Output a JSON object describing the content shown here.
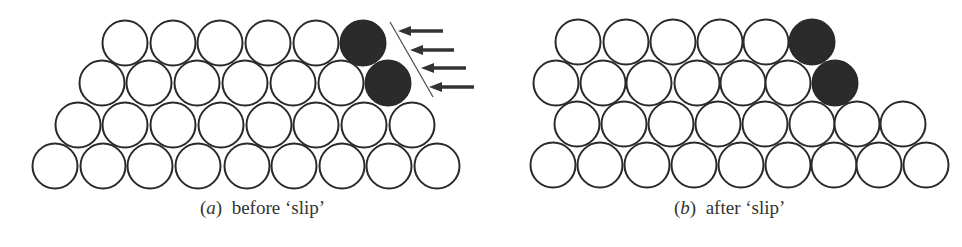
{
  "panels": [
    {
      "id": "a",
      "caption_letter": "a",
      "caption_text": "before ‘slip’",
      "caption_x": 200,
      "rows": [
        {
          "y": 43,
          "x": [
            125,
            173,
            220,
            268,
            316
          ],
          "dark": [
            363
          ]
        },
        {
          "y": 83,
          "x": [
            102,
            149,
            197,
            245,
            293,
            341
          ],
          "dark": [
            388
          ]
        },
        {
          "y": 125,
          "x": [
            78,
            125,
            173,
            221,
            269,
            316,
            364,
            412
          ],
          "dark": []
        },
        {
          "y": 166,
          "x": [
            55,
            103,
            150,
            198,
            247,
            294,
            342,
            389,
            437
          ],
          "dark": []
        }
      ],
      "slip_line": {
        "x1": 390,
        "y1": 22,
        "x2": 433,
        "y2": 97
      },
      "arrows": [
        {
          "y": 31,
          "tip": 398,
          "tail": 443
        },
        {
          "y": 50,
          "tip": 410,
          "tail": 454
        },
        {
          "y": 68,
          "tip": 421,
          "tail": 466
        },
        {
          "y": 87,
          "tip": 429,
          "tail": 474
        }
      ]
    },
    {
      "id": "b",
      "caption_letter": "b",
      "caption_text": "after ‘slip’",
      "caption_x": 674,
      "rows": [
        {
          "y": 42,
          "x": [
            578,
            626,
            673,
            720,
            766
          ],
          "dark": [
            812
          ]
        },
        {
          "y": 83,
          "x": [
            556,
            603,
            649,
            697,
            743,
            788
          ],
          "dark": [
            835
          ]
        },
        {
          "y": 124,
          "x": [
            577,
            624,
            671,
            718,
            765,
            812,
            857,
            903
          ],
          "dark": []
        },
        {
          "y": 165,
          "x": [
            553,
            600,
            647,
            694,
            741,
            788,
            834,
            879,
            926
          ],
          "dark": []
        }
      ]
    }
  ],
  "radius": 22.5,
  "colors": {
    "stroke": "#2a2a2a",
    "dark_fill": "#2b2b2b",
    "bg": "#ffffff"
  }
}
